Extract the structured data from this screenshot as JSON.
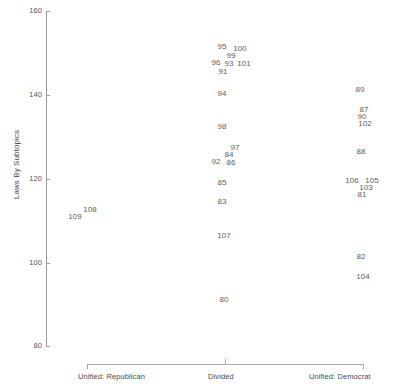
{
  "chart_data": {
    "type": "scatter",
    "title": "",
    "xlabel": "",
    "ylabel": "Laws By Subtopics",
    "ylim": [
      80,
      160
    ],
    "yticks": [
      80,
      100,
      120,
      140,
      160
    ],
    "ytick_labels": [
      "80",
      "100",
      "120",
      "140",
      "160"
    ],
    "grid": false,
    "legend": null,
    "x_categories": [
      "Unified: Republican",
      "Divided",
      "Unified: Democrat"
    ],
    "note": "Each plotted marker is rendered as its observation-number text label rather than a symbol.",
    "points": [
      {
        "label": "108",
        "x_category": "Unified: Republican",
        "px": 90,
        "py": 209,
        "y": 111.5
      },
      {
        "label": "109",
        "x_category": "Unified: Republican",
        "px": 75,
        "py": 216,
        "y": 110.0
      },
      {
        "label": "95",
        "x_category": "Divided",
        "px": 222,
        "py": 46,
        "y": 151.8
      },
      {
        "label": "100",
        "x_category": "Divided",
        "px": 240,
        "py": 48,
        "y": 151.3
      },
      {
        "label": "99",
        "x_category": "Divided",
        "px": 231,
        "py": 55,
        "y": 149.7
      },
      {
        "label": "96",
        "x_category": "Divided",
        "px": 216,
        "py": 62,
        "y": 148.1
      },
      {
        "label": "93",
        "x_category": "Divided",
        "px": 229,
        "py": 63,
        "y": 147.9
      },
      {
        "label": "101",
        "x_category": "Divided",
        "px": 244,
        "py": 63,
        "y": 147.9
      },
      {
        "label": "91",
        "x_category": "Divided",
        "px": 223,
        "py": 71,
        "y": 146.0
      },
      {
        "label": "94",
        "x_category": "Divided",
        "px": 222,
        "py": 93,
        "y": 140.9
      },
      {
        "label": "98",
        "x_category": "Divided",
        "px": 222,
        "py": 126,
        "y": 133.2
      },
      {
        "label": "97",
        "x_category": "Divided",
        "px": 235,
        "py": 147,
        "y": 128.3
      },
      {
        "label": "84",
        "x_category": "Divided",
        "px": 229,
        "py": 154,
        "y": 126.7
      },
      {
        "label": "92",
        "x_category": "Divided",
        "px": 216,
        "py": 161,
        "y": 125.0
      },
      {
        "label": "86",
        "x_category": "Divided",
        "px": 231,
        "py": 162,
        "y": 124.8
      },
      {
        "label": "85",
        "x_category": "Divided",
        "px": 222,
        "py": 182,
        "y": 120.1
      },
      {
        "label": "83",
        "x_category": "Divided",
        "px": 222,
        "py": 201,
        "y": 115.7
      },
      {
        "label": "107",
        "x_category": "Divided",
        "px": 224,
        "py": 235,
        "y": 107.8
      },
      {
        "label": "80",
        "x_category": "Divided",
        "px": 224,
        "py": 299,
        "y": 92.9
      },
      {
        "label": "89",
        "x_category": "Unified: Democrat",
        "px": 360,
        "py": 89,
        "y": 141.9
      },
      {
        "label": "87",
        "x_category": "Unified: Democrat",
        "px": 364,
        "py": 109,
        "y": 137.2
      },
      {
        "label": "90",
        "x_category": "Unified: Democrat",
        "px": 362,
        "py": 116,
        "y": 135.6
      },
      {
        "label": "102",
        "x_category": "Unified: Democrat",
        "px": 365,
        "py": 123,
        "y": 134.0
      },
      {
        "label": "88",
        "x_category": "Unified: Democrat",
        "px": 361,
        "py": 151,
        "y": 127.4
      },
      {
        "label": "106",
        "x_category": "Unified: Democrat",
        "px": 352,
        "py": 180,
        "y": 120.6
      },
      {
        "label": "105",
        "x_category": "Unified: Democrat",
        "px": 372,
        "py": 180,
        "y": 120.6
      },
      {
        "label": "103",
        "x_category": "Unified: Democrat",
        "px": 366,
        "py": 187,
        "y": 119.0
      },
      {
        "label": "81",
        "x_category": "Unified: Democrat",
        "px": 362,
        "py": 194,
        "y": 117.4
      },
      {
        "label": "82",
        "x_category": "Unified: Democrat",
        "px": 361,
        "py": 256,
        "y": 102.9
      },
      {
        "label": "104",
        "x_category": "Unified: Democrat",
        "px": 363,
        "py": 276,
        "y": 98.2
      }
    ]
  },
  "axes": {
    "y_title": "Laws By Subtopics",
    "y_ticks": [
      {
        "label": "160",
        "py": 11
      },
      {
        "label": "140",
        "py": 95
      },
      {
        "label": "120",
        "py": 179
      },
      {
        "label": "100",
        "py": 263
      },
      {
        "label": "80",
        "py": 346
      }
    ],
    "x_ticks": [
      {
        "label": "Unified: Republican",
        "px": 87,
        "anchor": "start"
      },
      {
        "label": "Divided",
        "px": 225,
        "anchor": "middle"
      },
      {
        "label": "Unified: Democrat",
        "px": 363,
        "anchor": "end"
      }
    ]
  },
  "colors": {
    "background": "#ffffff",
    "axis": "#9a9a9a",
    "tick_text": "#555555",
    "point_text": "#5c5c5c",
    "title_text": "#3f3f3f"
  }
}
